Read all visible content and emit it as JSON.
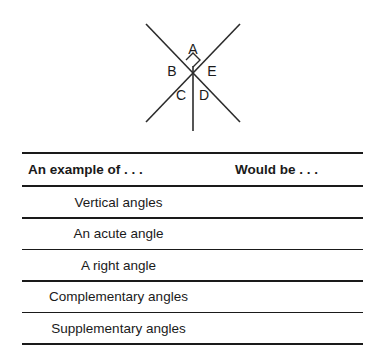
{
  "figure": {
    "name": "intersecting-lines-angle-diagram",
    "labels": [
      {
        "id": "A",
        "text": "A",
        "x": 193,
        "y": 50
      },
      {
        "id": "B",
        "text": "B",
        "x": 172,
        "y": 72
      },
      {
        "id": "E",
        "text": "E",
        "x": 212,
        "y": 72
      },
      {
        "id": "C",
        "text": "C",
        "x": 181,
        "y": 96
      },
      {
        "id": "D",
        "text": "D",
        "x": 204,
        "y": 96
      }
    ],
    "right_angle_marker": true,
    "line_color": "#2b2b2b"
  },
  "table": {
    "headers": {
      "left": "An example of . . .",
      "right": "Would be . . ."
    },
    "rows": [
      {
        "example": "Vertical angles",
        "answer": ""
      },
      {
        "example": "An acute angle",
        "answer": ""
      },
      {
        "example": "A right angle",
        "answer": ""
      },
      {
        "example": "Complementary angles",
        "answer": ""
      },
      {
        "example": "Supplementary angles",
        "answer": ""
      }
    ]
  }
}
